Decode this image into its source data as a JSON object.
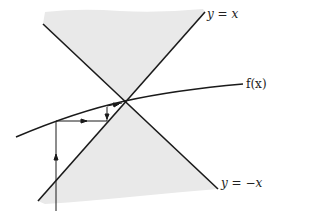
{
  "diagram": {
    "type": "cobweb-fixed-point-diagram",
    "colors": {
      "line": "#1a1a1a",
      "shade": "#e9e9e9",
      "background": "#ffffff"
    },
    "labels": {
      "line_y_eq_x": "y = x",
      "line_y_eq_neg_x": "y = −x",
      "curve": "f(x)"
    },
    "elements": {
      "line_y_eq_x": {
        "x1": 38,
        "y1": 201,
        "x2": 205,
        "y2": 12
      },
      "line_y_eq_neg_x": {
        "x1": 43,
        "y1": 24,
        "x2": 218,
        "y2": 189
      },
      "fixed_point": {
        "x": 125,
        "y": 101
      },
      "curve_f": {
        "start": [
          16,
          137
        ],
        "control": [
          75,
          112
        ],
        "end": [
          243,
          84
        ]
      },
      "cobweb_path": [
        {
          "from": [
            56,
            211
          ],
          "to": [
            56,
            121
          ],
          "arrow_at": [
            56,
            158
          ],
          "direction": "up"
        },
        {
          "from": [
            56,
            121
          ],
          "to": [
            107,
            121
          ],
          "arrow_at": [
            84,
            121
          ],
          "direction": "right"
        },
        {
          "from": [
            107,
            107
          ],
          "to": [
            107,
            121
          ],
          "arrow_at": [
            107,
            117
          ],
          "direction": "down"
        },
        {
          "from": [
            107,
            107
          ],
          "to": [
            121,
            104
          ],
          "arrow_at": [
            117,
            105
          ],
          "direction": "right"
        }
      ]
    }
  }
}
